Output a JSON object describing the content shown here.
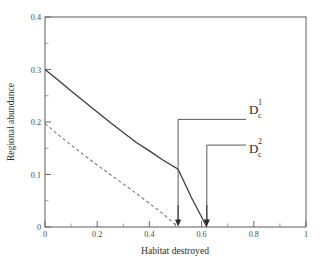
{
  "chart_data": {
    "type": "line",
    "title": "",
    "xlabel": "Habitat destroyed",
    "ylabel": "Regional abundance",
    "xlim": [
      0,
      1
    ],
    "ylim": [
      0,
      0.4
    ],
    "grid": false,
    "legend": "none",
    "xticks": [
      "0",
      "0.2",
      "0.4",
      "0.6",
      "0.8",
      "1"
    ],
    "xtick_values": [
      0,
      0.2,
      0.4,
      0.6,
      0.8,
      1
    ],
    "xminor_values": [
      0.1,
      0.3,
      0.5,
      0.7,
      0.9
    ],
    "yticks": [
      "0",
      "0.1",
      "0.2",
      "0.3",
      "0.4"
    ],
    "ytick_values": [
      0,
      0.1,
      0.2,
      0.3,
      0.4
    ],
    "yminor_values": [
      0.05,
      0.15,
      0.25,
      0.35
    ],
    "series": [
      {
        "name": "species-1-solid",
        "style": "solid",
        "color": "#3a3a3a",
        "x": [
          0.0,
          0.05,
          0.1,
          0.15,
          0.2,
          0.25,
          0.3,
          0.35,
          0.4,
          0.45,
          0.51,
          0.56,
          0.62
        ],
        "values": [
          0.3,
          0.28,
          0.259,
          0.239,
          0.219,
          0.199,
          0.18,
          0.161,
          0.145,
          0.128,
          0.11,
          0.057,
          0.0
        ]
      },
      {
        "name": "species-2-dashed",
        "style": "dashed",
        "color": "#7a7a7a",
        "x": [
          0.0,
          0.05,
          0.1,
          0.15,
          0.2,
          0.25,
          0.3,
          0.35,
          0.4,
          0.45,
          0.51
        ],
        "values": [
          0.197,
          0.176,
          0.156,
          0.137,
          0.118,
          0.1,
          0.082,
          0.064,
          0.045,
          0.026,
          0.0
        ]
      }
    ],
    "annotations": [
      {
        "name": "dc1",
        "base": "D",
        "subscript": "c",
        "superscript": "1",
        "x_value": 0.51,
        "leader_y_value": 0.205
      },
      {
        "name": "dc2",
        "base": "D",
        "subscript": "c",
        "superscript": "2",
        "x_value": 0.62,
        "leader_y_value": 0.156
      }
    ],
    "arrows": [
      {
        "name": "arrow-dc1",
        "x_value": 0.51,
        "points_to": 0.0
      },
      {
        "name": "arrow-dc2",
        "x_value": 0.62,
        "points_to": 0.0
      }
    ]
  }
}
